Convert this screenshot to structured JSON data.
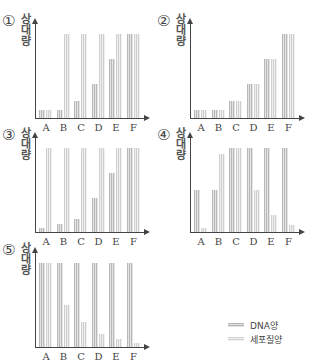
{
  "chart_data": [
    {
      "type": "bar",
      "option": "①",
      "ylabel": "상대량",
      "categories": [
        "A",
        "B",
        "C",
        "D",
        "E",
        "F"
      ],
      "series": [
        {
          "name": "DNA양",
          "values": [
            1,
            1,
            2,
            4,
            7,
            10
          ]
        },
        {
          "name": "세포질양",
          "values": [
            1,
            10,
            10,
            10,
            10,
            10
          ]
        }
      ],
      "ylim": [
        0,
        10
      ]
    },
    {
      "type": "bar",
      "option": "②",
      "ylabel": "상대량",
      "categories": [
        "A",
        "B",
        "C",
        "D",
        "E",
        "F"
      ],
      "series": [
        {
          "name": "DNA양",
          "values": [
            1,
            1,
            2,
            4,
            7,
            10
          ]
        },
        {
          "name": "세포질양",
          "values": [
            1,
            1,
            2,
            4,
            7,
            10
          ]
        }
      ],
      "ylim": [
        0,
        10
      ]
    },
    {
      "type": "bar",
      "option": "③",
      "ylabel": "상대량",
      "categories": [
        "A",
        "B",
        "C",
        "D",
        "E",
        "F"
      ],
      "series": [
        {
          "name": "DNA양",
          "values": [
            0.5,
            1,
            1.5,
            4,
            7,
            10
          ]
        },
        {
          "name": "세포질양",
          "values": [
            10,
            10,
            10,
            10,
            10,
            10
          ]
        }
      ],
      "ylim": [
        0,
        10
      ]
    },
    {
      "type": "bar",
      "option": "④",
      "ylabel": "상대량",
      "categories": [
        "A",
        "B",
        "C",
        "D",
        "E",
        "F"
      ],
      "series": [
        {
          "name": "DNA양",
          "values": [
            5,
            5,
            10,
            10,
            10,
            10
          ]
        },
        {
          "name": "세포질양",
          "values": [
            0.5,
            9.3,
            10,
            5,
            2,
            0.8
          ]
        }
      ],
      "ylim": [
        0,
        10
      ]
    },
    {
      "type": "bar",
      "option": "⑤",
      "ylabel": "상대량",
      "categories": [
        "A",
        "B",
        "C",
        "D",
        "E",
        "F"
      ],
      "series": [
        {
          "name": "DNA양",
          "values": [
            10,
            10,
            10,
            10,
            10,
            10
          ]
        },
        {
          "name": "세포질양",
          "values": [
            10,
            5,
            3,
            1.5,
            1,
            0.5
          ]
        }
      ],
      "ylim": [
        0,
        10
      ]
    }
  ],
  "panels": [
    {
      "num": "①",
      "ylabel": [
        "상",
        "대",
        "량"
      ]
    },
    {
      "num": "②",
      "ylabel": [
        "상",
        "대",
        "량"
      ]
    },
    {
      "num": "③",
      "ylabel": [
        "상",
        "대",
        "량"
      ]
    },
    {
      "num": "④",
      "ylabel": [
        "상",
        "대",
        "량"
      ]
    },
    {
      "num": "⑤",
      "ylabel": [
        "상",
        "대",
        "량"
      ]
    }
  ],
  "categories": [
    "A",
    "B",
    "C",
    "D",
    "E",
    "F"
  ],
  "legend": {
    "dna": "DNA양",
    "cytoplasm": "세포질양"
  }
}
